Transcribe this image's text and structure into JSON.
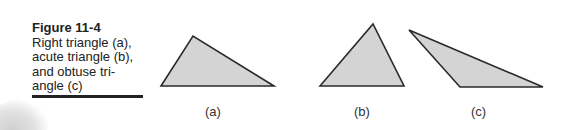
{
  "caption": {
    "title": "Figure 11-4",
    "text": "Right triangle (a), acute triangle (b), and obtuse tri-angle (c)"
  },
  "colors": {
    "fill": "#d4d4d4",
    "stroke": "#2a2a2a"
  },
  "triangles": [
    {
      "id": "a",
      "label": "(a)",
      "type": "right",
      "points": "161,86 193,36 274,86"
    },
    {
      "id": "b",
      "label": "(b)",
      "type": "acute",
      "points": "320,86 373,24 404,86"
    },
    {
      "id": "c",
      "label": "(c)",
      "type": "obtuse",
      "points": "409,30 460,87 543,87"
    }
  ]
}
